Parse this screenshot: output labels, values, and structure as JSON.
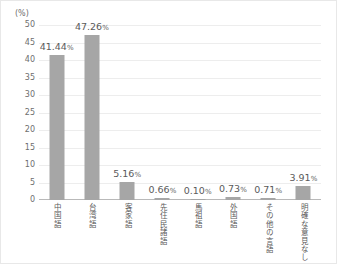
{
  "chart_data": {
    "type": "bar",
    "title": "",
    "subtitle": "",
    "unit_label": "(%)",
    "xlabel": "",
    "ylabel": "",
    "ylim": [
      0,
      50
    ],
    "ytick_step": 5,
    "yticks": [
      "0",
      "5",
      "10",
      "15",
      "20",
      "25",
      "30",
      "35",
      "40",
      "45",
      "50"
    ],
    "grid": true,
    "legend": false,
    "bar_color": "#a6a6a6",
    "gridline_color": "#ededed",
    "axis_color": "#b9b9b9",
    "text_color": "#5a5a5a",
    "categories": [
      "中国語",
      "台湾語",
      "客家語",
      "先住民諸語",
      "馬祖語",
      "外国語",
      "その他の言語",
      "明確な意見なし"
    ],
    "values": [
      41.44,
      47.26,
      5.16,
      0.66,
      0.1,
      0.73,
      0.71,
      3.91
    ],
    "value_labels": [
      "41.44",
      "47.26",
      "5.16",
      "0.66",
      "0.10",
      "0.73",
      "0.71",
      "3.91"
    ],
    "value_suffix": "%"
  }
}
